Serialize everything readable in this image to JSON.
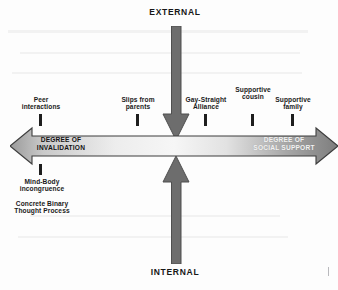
{
  "diagram": {
    "title_external": "EXTERNAL",
    "title_internal": "INTERNAL",
    "horizontal_axis": {
      "left_label": "DEGREE OF\nINVALIDATION",
      "right_label": "DEGREE OF\nSOCIAL SUPPORT",
      "left_label_color": "#141414",
      "right_label_color": "#f2f2f2",
      "bar_fill_light": "#f4f4f4",
      "bar_fill_dark": "#8f8f8f",
      "bar_stroke": "#3a3a3a"
    },
    "vertical_axis": {
      "arrow_color": "#6d6d6d",
      "arrow_stroke": "#4a4a4a",
      "down_arrow_name": "external-to-internal-arrow",
      "up_arrow_name": "internal-to-external-arrow"
    },
    "nodes_above": [
      {
        "label": "Peer\ninteractions",
        "x": 40
      },
      {
        "label": "Slips from\nparents",
        "x": 137
      },
      {
        "label": "Gay-Straight\nAlliance",
        "x": 205
      },
      {
        "label": "Supportive\ncousin",
        "x": 252
      },
      {
        "label": "Supportive\nfamily",
        "x": 292
      }
    ],
    "nodes_below": [
      {
        "label": "Mind-Body\nincongruence",
        "x": 40
      },
      {
        "label": "Concrete Binary\nThought Process",
        "x": 40
      }
    ],
    "tick_color": "#1e1e1e"
  }
}
